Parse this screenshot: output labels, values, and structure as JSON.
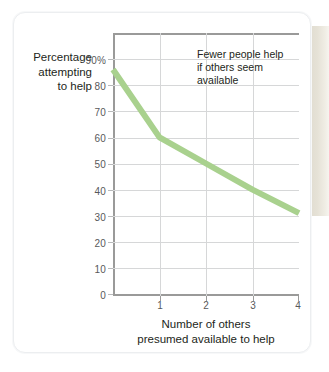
{
  "chart_data": {
    "type": "line",
    "title": "",
    "annotation": [
      "Fewer people help",
      "if others seem",
      "available"
    ],
    "xlabel": [
      "Number of others",
      "presumed available to help"
    ],
    "ylabel": [
      "Percentage",
      "attempting",
      "to help"
    ],
    "x": [
      0,
      1,
      2,
      3,
      4
    ],
    "values": [
      86,
      60,
      50,
      40,
      31
    ],
    "series": [
      {
        "name": "Percentage attempting to help",
        "values": [
          86,
          60,
          50,
          40,
          31
        ]
      }
    ],
    "xticks": [
      "1",
      "2",
      "3",
      "4"
    ],
    "xtick_values": [
      1,
      2,
      3,
      4
    ],
    "yticks": [
      "0",
      "10",
      "20",
      "30",
      "40",
      "50",
      "60",
      "70",
      "80",
      "90%"
    ],
    "ytick_values": [
      0,
      10,
      20,
      30,
      40,
      50,
      60,
      70,
      80,
      90
    ],
    "xlim": [
      0,
      4
    ],
    "ylim": [
      0,
      100
    ],
    "grid": true,
    "legend": false,
    "line_color": "#a9d18e",
    "grid_color": "#d6d7d8",
    "axis_color": "#9a9a99"
  },
  "figure": {
    "y_axis_title_line1": "Percentage",
    "y_axis_title_line2": "attempting",
    "y_axis_title_line3": "to help",
    "x_axis_title_line1": "Number of others",
    "x_axis_title_line2": "presumed available to help",
    "annotation_line1": "Fewer people help",
    "annotation_line2": "if others seem",
    "annotation_line3": "available",
    "ytick_0": "0",
    "ytick_10": "10",
    "ytick_20": "20",
    "ytick_30": "30",
    "ytick_40": "40",
    "ytick_50": "50",
    "ytick_60": "60",
    "ytick_70": "70",
    "ytick_80": "80",
    "ytick_90": "90%",
    "xtick_1": "1",
    "xtick_2": "2",
    "xtick_3": "3",
    "xtick_4": "4"
  }
}
